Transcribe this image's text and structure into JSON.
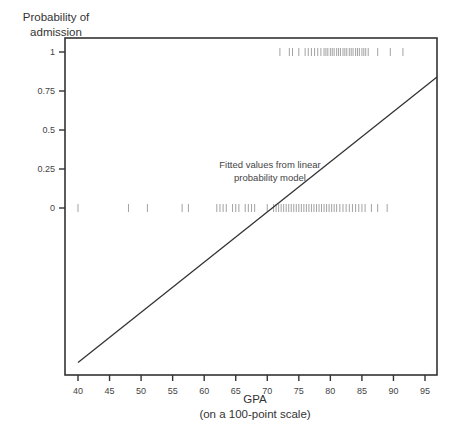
{
  "chart_data": {
    "type": "scatter",
    "title": "",
    "xlabel": "GPA",
    "xlabel_sub": "(on a 100-point scale)",
    "ylabel": "Probability of admission",
    "xlim": [
      38,
      97
    ],
    "ylim": [
      -1.1,
      1.2
    ],
    "x_ticks": [
      40,
      45,
      50,
      55,
      60,
      65,
      70,
      75,
      80,
      85,
      90,
      95
    ],
    "y_ticks": [
      0,
      0.25,
      0.5,
      0.75,
      1
    ],
    "y_tick_labels": [
      "0",
      "0.25",
      "0.5",
      "0.75",
      "1"
    ],
    "grid": false,
    "legend": null,
    "annotation": "Fitted values from linear probability model",
    "series": [
      {
        "name": "Admitted (y=1) observations",
        "type": "rug",
        "y": 1,
        "x": [
          72,
          73.5,
          74,
          75,
          76,
          76.5,
          77,
          77.5,
          78,
          78.5,
          79,
          79.3,
          79.6,
          80,
          80.3,
          80.6,
          81,
          81.3,
          81.6,
          82,
          82.3,
          82.6,
          83,
          83.3,
          83.6,
          84,
          84.3,
          84.6,
          85,
          85.3,
          85.6,
          86,
          87.5,
          89.5,
          91.5
        ]
      },
      {
        "name": "Not admitted (y=0) observations",
        "type": "rug",
        "y": 0,
        "x": [
          40,
          48,
          51,
          56.5,
          57.5,
          62,
          62.5,
          63,
          63.5,
          64.5,
          65,
          65.5,
          66.5,
          67,
          67.5,
          68,
          70,
          71,
          71.4,
          71.8,
          72.2,
          72.6,
          73,
          73.4,
          73.8,
          74.2,
          74.6,
          75,
          75.4,
          75.8,
          76.2,
          76.6,
          77,
          77.4,
          77.8,
          78.2,
          78.6,
          79,
          79.4,
          79.8,
          80.2,
          80.6,
          81,
          81.5,
          82,
          82.5,
          83,
          83.5,
          84,
          84.5,
          85,
          85.5,
          86.5,
          87.5,
          89
        ]
      },
      {
        "name": "Fitted values from linear probability model",
        "type": "line",
        "x": [
          40,
          97
        ],
        "y": [
          -0.99,
          0.84
        ]
      }
    ]
  },
  "labels": {
    "ylabel_line1": "Probability of",
    "ylabel_line2": "admission",
    "xlabel_line1": "GPA",
    "xlabel_line2": "(on a 100-point scale)",
    "annotation_line1": "Fitted values from linear",
    "annotation_line2": "probability model"
  }
}
